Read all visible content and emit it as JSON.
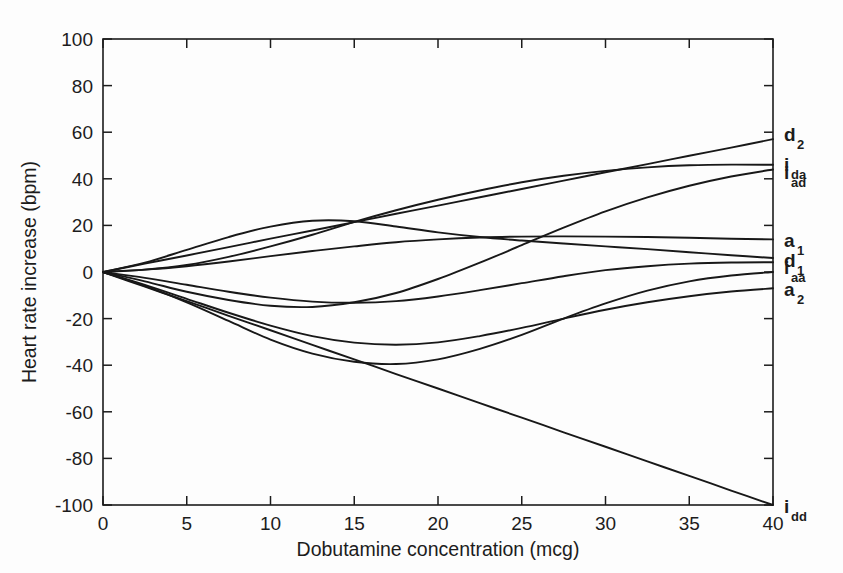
{
  "figure": {
    "background_color": "#fdfdfd",
    "line_color": "#181818",
    "text_color": "#1c1c1c"
  },
  "chart_data": {
    "type": "line",
    "title": "",
    "subtitle": "",
    "xlabel": "Dobutamine concentration (mcg)",
    "ylabel": "Heart rate increase (bpm)",
    "xlim": [
      0,
      40
    ],
    "ylim": [
      -100,
      100
    ],
    "xticks": [
      0,
      5,
      10,
      15,
      20,
      25,
      30,
      35,
      40
    ],
    "xtick_labels": [
      "0",
      "5",
      "10",
      "15",
      "20",
      "25",
      "30",
      "35",
      "40"
    ],
    "yticks": [
      -100,
      -80,
      -60,
      -40,
      -20,
      0,
      20,
      40,
      60,
      80,
      100
    ],
    "ytick_labels": [
      "-100",
      "-80",
      "-60",
      "-40",
      "-20",
      "0",
      "20",
      "40",
      "60",
      "80",
      "100"
    ],
    "grid": false,
    "legend_position": "right-of-axes-end-labels",
    "x": [
      0,
      2.5,
      5,
      7.5,
      10,
      12.5,
      15,
      17.5,
      20,
      22.5,
      25,
      27.5,
      30,
      32.5,
      35,
      37.5,
      40
    ],
    "series": [
      {
        "name": "d_2",
        "label_base": "d",
        "label_sub": "2",
        "end_value": 57,
        "values": [
          0,
          3.6,
          7.1,
          10.7,
          14.3,
          17.8,
          21.4,
          25.0,
          28.5,
          32.1,
          35.6,
          39.2,
          42.8,
          46.3,
          49.9,
          53.4,
          57.0
        ]
      },
      {
        "name": "i_da",
        "label_base": "i",
        "label_sub": "da",
        "end_value": 46,
        "values": [
          0,
          1.0,
          3.0,
          6.5,
          11.0,
          16.0,
          21.5,
          26.5,
          31.0,
          35.0,
          38.5,
          41.3,
          43.4,
          44.9,
          45.8,
          46.1,
          46.0
        ]
      },
      {
        "name": "i_ad",
        "label_base": "i",
        "label_sub": "ad",
        "end_value": 44,
        "values": [
          0,
          -4.0,
          -8.5,
          -12.0,
          -14.5,
          -15.0,
          -13.0,
          -9.0,
          -3.0,
          4.0,
          11.5,
          19.0,
          26.0,
          32.0,
          37.0,
          41.0,
          44.0
        ]
      },
      {
        "name": "a_1",
        "label_base": "a",
        "label_sub": "1",
        "end_value": 14,
        "values": [
          0,
          1.0,
          2.5,
          4.5,
          6.8,
          9.0,
          11.0,
          12.8,
          14.0,
          14.8,
          15.2,
          15.3,
          15.2,
          15.0,
          14.7,
          14.3,
          14.0
        ]
      },
      {
        "name": "d_1",
        "label_base": "d",
        "label_sub": "1",
        "end_value": 6,
        "values": [
          0,
          4.0,
          9.5,
          15.0,
          19.5,
          22.0,
          21.8,
          19.5,
          17.0,
          15.0,
          13.5,
          12.2,
          11.0,
          9.8,
          8.5,
          7.2,
          6.0
        ]
      },
      {
        "name": "i_aa",
        "label_base": "i",
        "label_sub": "aa",
        "end_value": 4,
        "values": [
          0,
          -2.5,
          -5.5,
          -8.5,
          -11.0,
          -12.7,
          -13.2,
          -12.5,
          -10.5,
          -7.8,
          -4.8,
          -1.8,
          0.8,
          2.5,
          3.6,
          4.1,
          4.2
        ]
      },
      {
        "name": "a_2",
        "label_base": "a",
        "label_sub": "2",
        "end_value": -7,
        "values": [
          0,
          -5.5,
          -11.5,
          -17.5,
          -23.0,
          -27.5,
          -30.3,
          -31.2,
          -30.2,
          -27.5,
          -24.0,
          -20.0,
          -16.2,
          -13.0,
          -10.4,
          -8.4,
          -7.0
        ]
      },
      {
        "name": "i_dd",
        "label_base": "i",
        "label_sub": "dd",
        "end_value": -100,
        "values": [
          0,
          -6.3,
          -12.5,
          -18.8,
          -25.0,
          -31.3,
          -37.5,
          -43.8,
          -50.0,
          -56.3,
          -62.5,
          -68.8,
          -75.0,
          -81.3,
          -87.5,
          -93.8,
          -100.0
        ]
      }
    ],
    "trough_curve": {
      "name": "deep-trough",
      "values": [
        0,
        -6.0,
        -13.0,
        -21.0,
        -29.0,
        -35.0,
        -38.5,
        -39.5,
        -37.5,
        -33.0,
        -27.0,
        -20.0,
        -13.5,
        -8.0,
        -4.0,
        -1.5,
        0.0
      ]
    }
  }
}
